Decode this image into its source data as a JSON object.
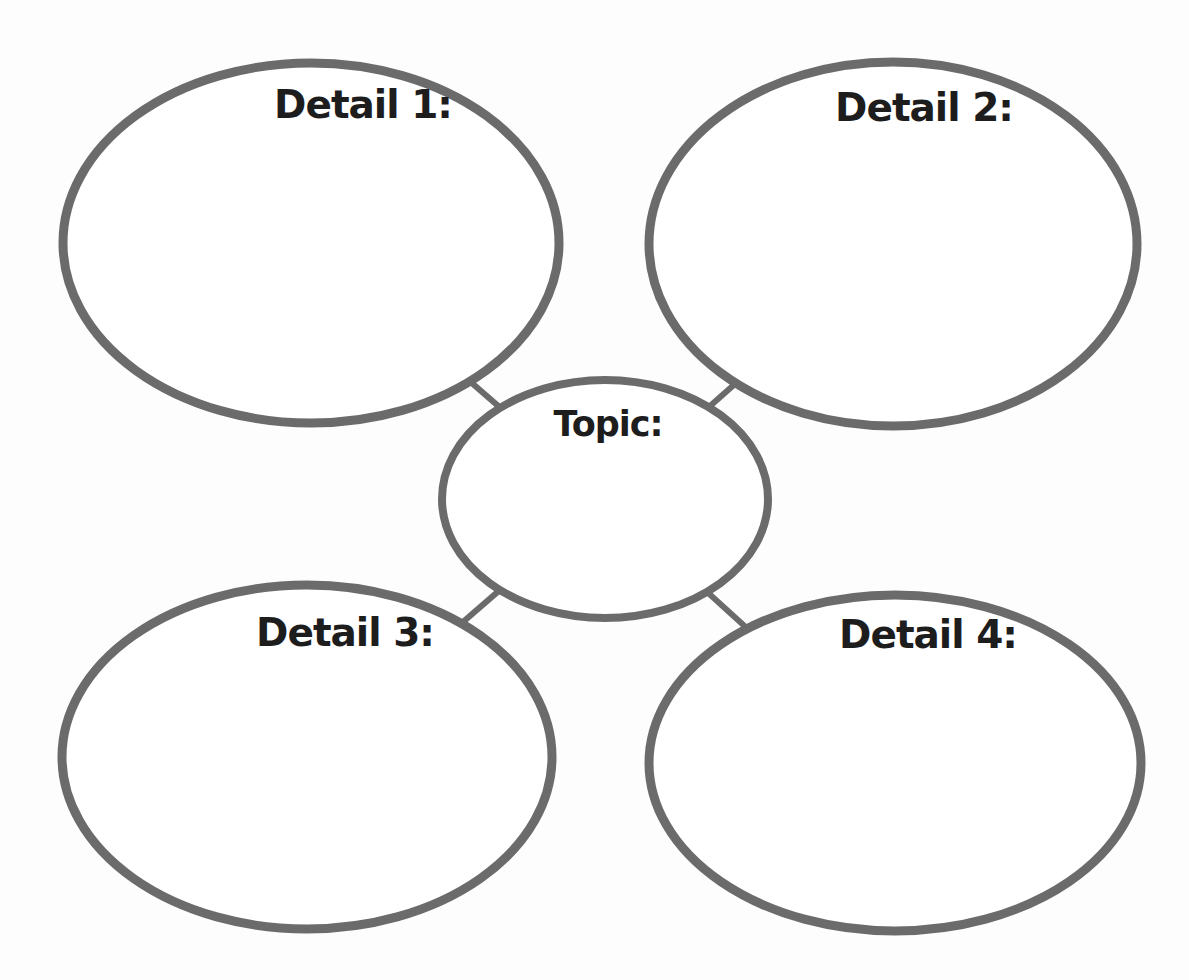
{
  "page": {
    "background": "#fdfdfd"
  },
  "diagram": {
    "type": "cluster-web-graphic-organizer",
    "topic": {
      "label": "Topic:"
    },
    "details": [
      {
        "label": "Detail 1:"
      },
      {
        "label": "Detail 2:"
      },
      {
        "label": "Detail 3:"
      },
      {
        "label": "Detail 4:"
      }
    ],
    "colors": {
      "outline": "#6b6b6b",
      "label_text": "#1d1d1d",
      "node_fill": "#ffffff"
    }
  }
}
